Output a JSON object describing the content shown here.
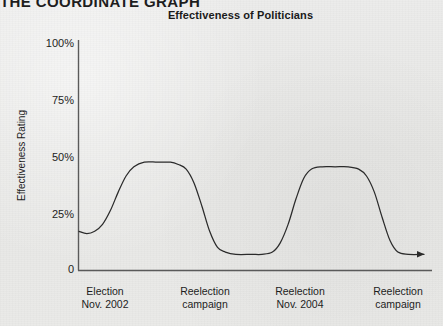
{
  "page": {
    "section_header": "THE COORDINATE GRAPH",
    "background_color": "#e9e9e7",
    "ink_color": "#1d1d1d"
  },
  "chart_data": {
    "type": "line",
    "title": "Effectiveness of Politicians",
    "xlabel": "",
    "ylabel": "Effectiveness Rating",
    "ylim": [
      0,
      100
    ],
    "ytick_labels": [
      "100%",
      "75%",
      "50%",
      "25%",
      "0"
    ],
    "ytick_values": [
      100,
      75,
      50,
      25,
      0
    ],
    "grid": false,
    "legend": "none",
    "axis_arrow": "x-axis curve ends with arrowhead pointing right",
    "xtick_labels": [
      {
        "line1": "Election",
        "line2": "Nov. 2002"
      },
      {
        "line1": "Reelection",
        "line2": "campaign"
      },
      {
        "line1": "Reelection",
        "line2": "Nov. 2004"
      },
      {
        "line1": "Reelection",
        "line2": "campaign"
      }
    ],
    "xtick_positions": [
      105,
      205,
      300,
      398
    ],
    "series": [
      {
        "name": "Effectiveness",
        "description": "Two broad plateaus of high effectiveness after each election, dropping to a low trough during each reelection campaign.",
        "points": [
          {
            "x": 0,
            "y": 17
          },
          {
            "x": 3,
            "y": 16
          },
          {
            "x": 6,
            "y": 17
          },
          {
            "x": 9,
            "y": 20
          },
          {
            "x": 12,
            "y": 26
          },
          {
            "x": 15,
            "y": 34
          },
          {
            "x": 18,
            "y": 41
          },
          {
            "x": 21,
            "y": 45
          },
          {
            "x": 25,
            "y": 47
          },
          {
            "x": 30,
            "y": 47
          },
          {
            "x": 35,
            "y": 47
          },
          {
            "x": 38,
            "y": 46
          },
          {
            "x": 41,
            "y": 44
          },
          {
            "x": 44,
            "y": 38
          },
          {
            "x": 47,
            "y": 28
          },
          {
            "x": 50,
            "y": 17
          },
          {
            "x": 53,
            "y": 10
          },
          {
            "x": 56,
            "y": 8
          },
          {
            "x": 60,
            "y": 7
          },
          {
            "x": 66,
            "y": 7
          },
          {
            "x": 70,
            "y": 7
          },
          {
            "x": 74,
            "y": 8
          },
          {
            "x": 77,
            "y": 12
          },
          {
            "x": 80,
            "y": 20
          },
          {
            "x": 83,
            "y": 31
          },
          {
            "x": 86,
            "y": 40
          },
          {
            "x": 89,
            "y": 44
          },
          {
            "x": 93,
            "y": 45
          },
          {
            "x": 98,
            "y": 45
          },
          {
            "x": 103,
            "y": 45
          },
          {
            "x": 107,
            "y": 44
          },
          {
            "x": 110,
            "y": 41
          },
          {
            "x": 113,
            "y": 34
          },
          {
            "x": 116,
            "y": 23
          },
          {
            "x": 119,
            "y": 13
          },
          {
            "x": 122,
            "y": 8
          },
          {
            "x": 126,
            "y": 7
          },
          {
            "x": 132,
            "y": 7
          }
        ]
      }
    ]
  }
}
